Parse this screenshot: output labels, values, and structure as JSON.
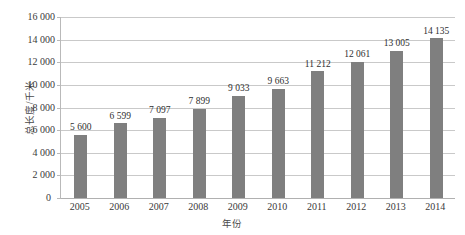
{
  "chart_data": {
    "type": "bar",
    "title": "",
    "xlabel": "年份",
    "ylabel": "总长度/千米",
    "categories": [
      "2005",
      "2006",
      "2007",
      "2008",
      "2009",
      "2010",
      "2011",
      "2012",
      "2013",
      "2014"
    ],
    "values": [
      5600,
      6599,
      7097,
      7899,
      9033,
      9663,
      11212,
      12061,
      13005,
      14135
    ],
    "value_labels": [
      "5 600",
      "6 599",
      "7 097",
      "7 899",
      "9 033",
      "9 663",
      "11 212",
      "12 061",
      "13 005",
      "14 135"
    ],
    "ylim": [
      0,
      16000
    ],
    "y_ticks": [
      0,
      2000,
      4000,
      6000,
      8000,
      10000,
      12000,
      14000,
      16000
    ],
    "y_tick_labels": [
      "0",
      "2 000",
      "4 000",
      "6 000",
      "8 000",
      "10 000",
      "12 000",
      "14 000",
      "16 000"
    ],
    "grid": true,
    "legend": "none",
    "series": [
      {
        "name": "总长度",
        "values": [
          5600,
          6599,
          7097,
          7899,
          9033,
          9663,
          11212,
          12061,
          13005,
          14135
        ]
      }
    ],
    "colors": {
      "bar": "#7f7f7f",
      "gridline": "#c9c9c9",
      "axis": "#b9b9b9",
      "background": "#ffffff",
      "text": "#3a3a3a"
    }
  }
}
